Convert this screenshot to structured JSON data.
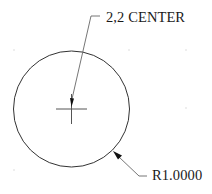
{
  "drawing": {
    "colors": {
      "background": "#ffffff",
      "geometry": "#333333",
      "leader": "#555555",
      "grid_dot": "#bbbbbb"
    },
    "circle": {
      "center_px": [
        71,
        109
      ],
      "radius_px": 58
    },
    "annotations": {
      "center_label": "2,2 CENTER",
      "radius_label": "R1.0000"
    },
    "grid_dots_px": [
      [
        14,
        50
      ],
      [
        129,
        50
      ],
      [
        186,
        50
      ],
      [
        186,
        108
      ],
      [
        14,
        170
      ]
    ]
  }
}
